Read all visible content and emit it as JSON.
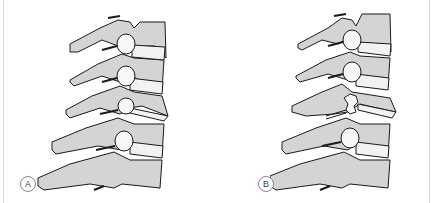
{
  "figure": {
    "colors": {
      "bone_fill": "#d4d4d4",
      "outline": "#1a1a1a",
      "disc_fill": "#f2f2f2",
      "background": "#ffffff"
    },
    "panels": [
      {
        "id": "A",
        "label": "A",
        "state": "intact facet at third level"
      },
      {
        "id": "B",
        "label": "B",
        "state": "disrupted facet joint at third level"
      }
    ]
  }
}
